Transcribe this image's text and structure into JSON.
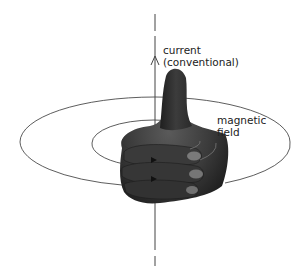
{
  "diagram": {
    "labels": {
      "current_line1": "current",
      "current_line2": "(conventional)",
      "field_line1": "magnetic",
      "field_line2": "field"
    },
    "colors": {
      "line": "#333333",
      "hand_dark": "#2a2a2a",
      "hand_mid": "#4a4a4a",
      "hand_light": "#6e6e6e",
      "background": "#ffffff"
    }
  }
}
